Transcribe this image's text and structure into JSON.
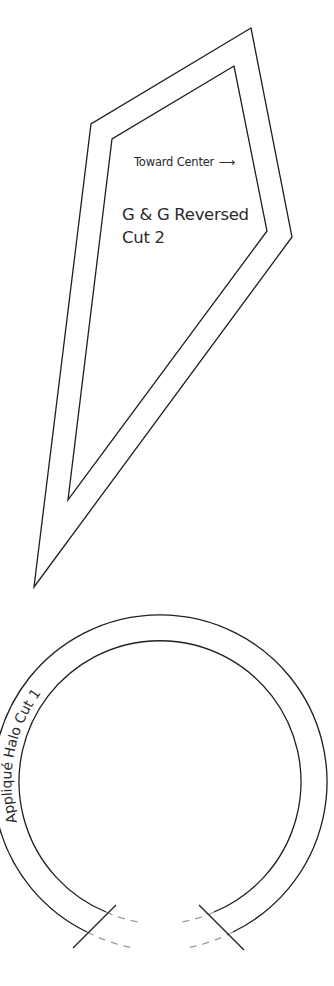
{
  "colors": {
    "line": "#1f1f1f",
    "dashed_line": "#9a9a9a",
    "text": "#2a2a2a",
    "background": "#ffffff"
  },
  "template_g": {
    "direction_label": "Toward Center",
    "direction_arrow": "⟶",
    "name": "G & G Reversed",
    "cut_instruction": "Cut 2"
  },
  "template_halo": {
    "label": "Appliqué Halo Cut 1"
  }
}
